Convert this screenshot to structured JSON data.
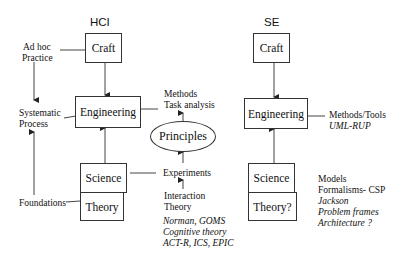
{
  "hci": {
    "title": "HCI",
    "craft": "Craft",
    "engineering": "Engineering",
    "science": "Science",
    "theory": "Theory",
    "left_labels": {
      "ad_hoc_1": "Ad hoc",
      "ad_hoc_2": "Practice",
      "systematic_1": "Systematic",
      "systematic_2": "Process",
      "foundations": "Foundations"
    },
    "principles": "Principles",
    "methods_1": "Methods",
    "methods_2": "Task analysis",
    "experiments": "Experiments",
    "interaction_1": "Interaction",
    "interaction_2": "Theory",
    "examples": [
      "Norman, GOMS",
      "Cognitive theory",
      "ACT-R, ICS, EPIC"
    ]
  },
  "se": {
    "title": "SE",
    "craft": "Craft",
    "engineering": "Engineering",
    "science": "Science",
    "theory": "Theory?",
    "methods_1": "Methods/Tools",
    "methods_2": "UML-RUP",
    "models": [
      "Models",
      "Formalisms- CSP"
    ],
    "models_italic": [
      "Jackson",
      "Problem frames",
      "Architecture ?"
    ]
  },
  "colors": {
    "line": "#333333",
    "text": "#111111",
    "background": "#ffffff"
  }
}
